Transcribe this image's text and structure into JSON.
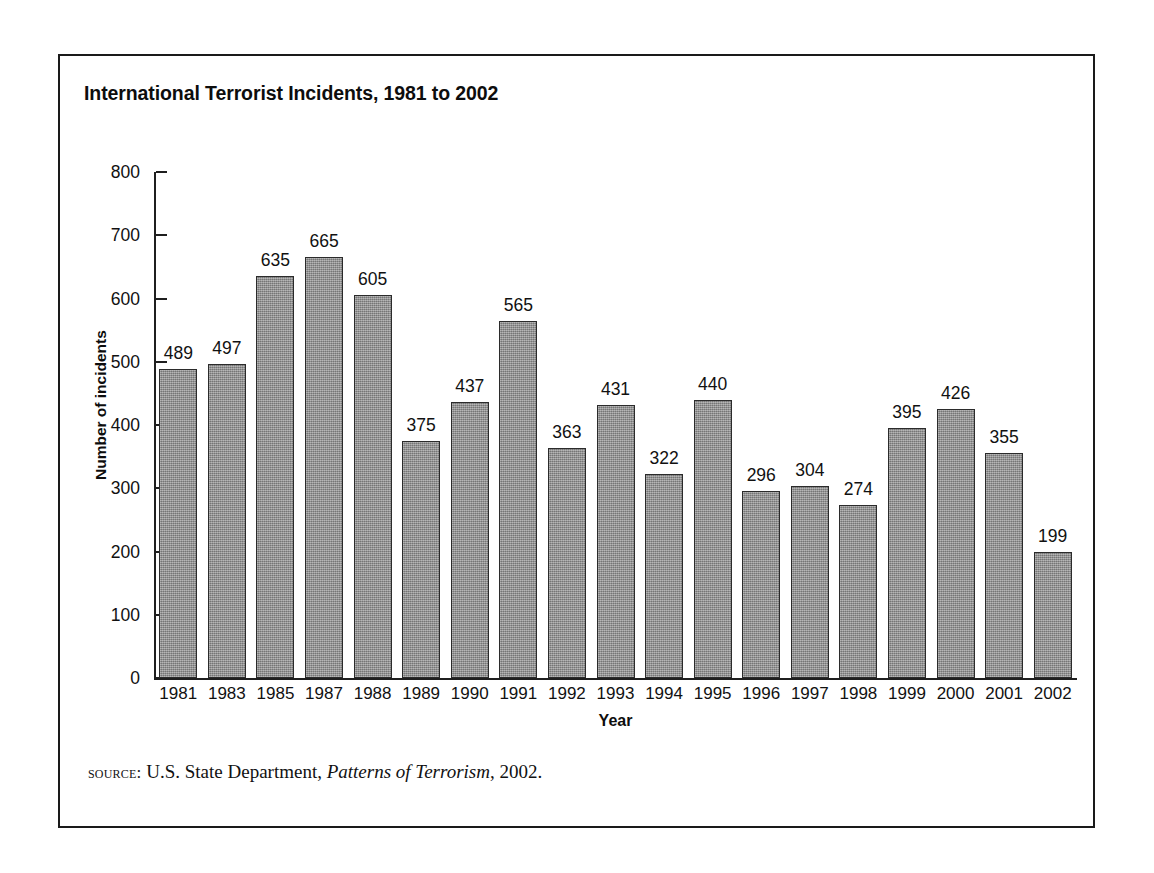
{
  "figure": {
    "title": "International Terrorist Incidents, 1981 to 2002",
    "source_prefix": "source:",
    "source_text_before": " U.S. State Department, ",
    "source_publication": "Patterns of Terrorism",
    "source_text_after": ", 2002."
  },
  "chart_data": {
    "type": "bar",
    "title": "International Terrorist Incidents, 1981 to 2002",
    "xlabel": "Year",
    "ylabel": "Number of incidents",
    "categories": [
      "1981",
      "1983",
      "1985",
      "1987",
      "1988",
      "1989",
      "1990",
      "1991",
      "1992",
      "1993",
      "1994",
      "1995",
      "1996",
      "1997",
      "1998",
      "1999",
      "2000",
      "2001",
      "2002"
    ],
    "values": [
      489,
      497,
      635,
      665,
      605,
      375,
      437,
      565,
      363,
      431,
      322,
      440,
      296,
      304,
      274,
      395,
      426,
      355,
      199
    ],
    "ylim": [
      0,
      800
    ],
    "yticks": [
      0,
      100,
      200,
      300,
      400,
      500,
      600,
      700,
      800
    ],
    "ytick_labels": [
      "0",
      "100",
      "200",
      "300",
      "400",
      "500",
      "600",
      "700",
      "800"
    ],
    "grid": false,
    "legend": null,
    "bar_fill_color": "#8e8e8e",
    "bar_border_color": "#2b2b2b",
    "axis_color": "#1f1f1f",
    "data_labels_shown": true
  }
}
